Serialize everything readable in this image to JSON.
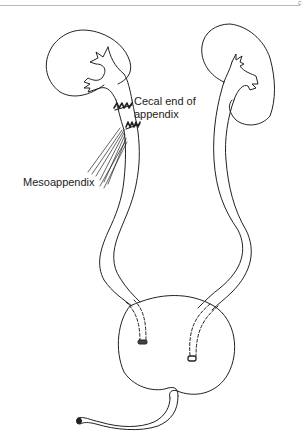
{
  "figure": {
    "corner_mark": "c",
    "labels": {
      "cecal_line1": "Cecal end of",
      "cecal_line2": "appendix",
      "mesoappendix": "Mesoappendix"
    },
    "structures": [
      "right-kidney",
      "left-kidney",
      "appendix-ureter-graft",
      "left-ureter",
      "bladder",
      "urethra"
    ],
    "colors": {
      "line": "#222222",
      "background": "#ffffff"
    }
  }
}
